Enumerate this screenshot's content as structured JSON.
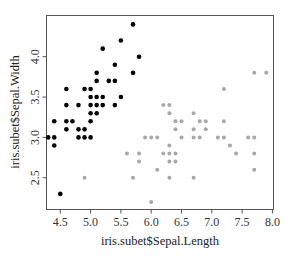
{
  "chart_data": {
    "type": "scatter",
    "title": "",
    "xlabel": "iris.subet$Sepal.Length",
    "ylabel": "iris.subet$Sepal.Width",
    "xlim": [
      4.2,
      8.05
    ],
    "ylim": [
      2.15,
      4.45
    ],
    "xticks": [
      4.5,
      5.0,
      5.5,
      6.0,
      6.5,
      7.0,
      7.5,
      8.0
    ],
    "xtick_labels": [
      "4.5",
      "5.0",
      "5.5",
      "6.0",
      "6.5",
      "7.0",
      "7.5",
      "8.0"
    ],
    "yticks": [
      2.5,
      3.0,
      3.5,
      4.0
    ],
    "ytick_labels": [
      "2.5",
      "3.0",
      "3.5",
      "4.0"
    ],
    "grid": false,
    "legend": null,
    "series": [
      {
        "name": "setosa",
        "color": "#000000",
        "points": [
          [
            5.7,
            4.4
          ],
          [
            5.5,
            4.2
          ],
          [
            5.2,
            4.1
          ],
          [
            5.8,
            4.0
          ],
          [
            5.4,
            3.9
          ],
          [
            5.1,
            3.8
          ],
          [
            5.7,
            3.8
          ],
          [
            5.1,
            3.7
          ],
          [
            5.3,
            3.7
          ],
          [
            5.4,
            3.7
          ],
          [
            4.6,
            3.6
          ],
          [
            4.9,
            3.6
          ],
          [
            5.0,
            3.6
          ],
          [
            5.0,
            3.5
          ],
          [
            5.1,
            3.5
          ],
          [
            5.2,
            3.5
          ],
          [
            5.5,
            3.5
          ],
          [
            4.6,
            3.4
          ],
          [
            4.8,
            3.4
          ],
          [
            5.0,
            3.4
          ],
          [
            5.1,
            3.4
          ],
          [
            5.2,
            3.4
          ],
          [
            5.4,
            3.4
          ],
          [
            5.0,
            3.3
          ],
          [
            5.1,
            3.3
          ],
          [
            4.4,
            3.2
          ],
          [
            4.6,
            3.2
          ],
          [
            4.7,
            3.2
          ],
          [
            5.0,
            3.2
          ],
          [
            4.6,
            3.1
          ],
          [
            4.8,
            3.1
          ],
          [
            4.9,
            3.1
          ],
          [
            4.3,
            3.0
          ],
          [
            4.4,
            3.0
          ],
          [
            4.8,
            3.0
          ],
          [
            4.9,
            3.0
          ],
          [
            5.0,
            3.0
          ],
          [
            4.4,
            2.9
          ],
          [
            4.5,
            2.3
          ]
        ]
      },
      {
        "name": "virginica",
        "color": "#a8a8a8",
        "points": [
          [
            7.7,
            3.8
          ],
          [
            7.9,
            3.8
          ],
          [
            7.2,
            3.6
          ],
          [
            6.2,
            3.4
          ],
          [
            6.3,
            3.4
          ],
          [
            6.3,
            3.3
          ],
          [
            6.7,
            3.3
          ],
          [
            6.4,
            3.2
          ],
          [
            6.5,
            3.2
          ],
          [
            6.8,
            3.2
          ],
          [
            6.9,
            3.2
          ],
          [
            7.2,
            3.2
          ],
          [
            6.4,
            3.1
          ],
          [
            6.7,
            3.1
          ],
          [
            6.9,
            3.1
          ],
          [
            5.9,
            3.0
          ],
          [
            6.0,
            3.0
          ],
          [
            6.1,
            3.0
          ],
          [
            6.5,
            3.0
          ],
          [
            6.7,
            3.0
          ],
          [
            6.8,
            3.0
          ],
          [
            7.1,
            3.0
          ],
          [
            7.2,
            3.0
          ],
          [
            7.6,
            3.0
          ],
          [
            7.7,
            3.0
          ],
          [
            6.3,
            2.9
          ],
          [
            7.3,
            2.9
          ],
          [
            5.6,
            2.8
          ],
          [
            5.8,
            2.8
          ],
          [
            6.2,
            2.8
          ],
          [
            6.3,
            2.8
          ],
          [
            6.4,
            2.8
          ],
          [
            7.4,
            2.8
          ],
          [
            7.7,
            2.8
          ],
          [
            5.8,
            2.7
          ],
          [
            6.3,
            2.7
          ],
          [
            6.4,
            2.7
          ],
          [
            6.1,
            2.6
          ],
          [
            7.7,
            2.6
          ],
          [
            4.9,
            2.5
          ],
          [
            5.7,
            2.5
          ],
          [
            6.3,
            2.5
          ],
          [
            6.7,
            2.5
          ],
          [
            6.0,
            2.2
          ]
        ]
      }
    ]
  }
}
